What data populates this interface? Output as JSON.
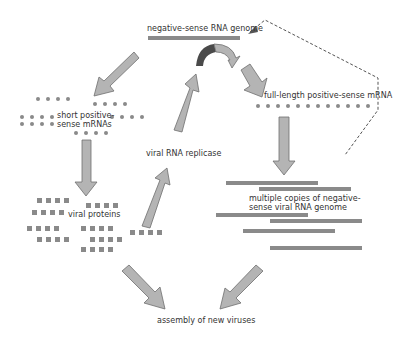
{
  "labels": {
    "genome": "negative-sense RNA genome",
    "full_mrna": "full-length positive-sense mRNA",
    "short_mrna_1": "short positive-",
    "short_mrna_2": "sense mRNAs",
    "replicase": "viral RNA replicase",
    "proteins": "viral proteins",
    "copies_1": "multiple copies of negative-",
    "copies_2": "sense viral RNA genome",
    "assembly": "assembly of new viruses"
  },
  "colors": {
    "bar": "#8a8a8a",
    "arrow_fill": "#b4b4b4",
    "arrow_stroke": "#6e6e6e",
    "arrow_dark": "#4a4a4a",
    "dot": "#8a8a8a",
    "text": "#333333"
  }
}
